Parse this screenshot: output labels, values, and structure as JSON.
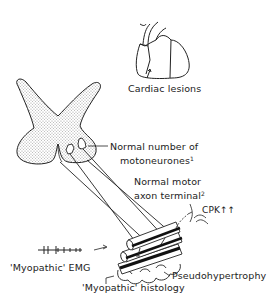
{
  "diagram": {
    "labels": {
      "cardiac": "Cardiac lesions",
      "motoneurones_line1": "Normal number of",
      "motoneurones_line2": "motoneurones",
      "motoneurones_ref": "1",
      "axon_line1": "Normal motor",
      "axon_line2": "axon terminal",
      "axon_ref": "2",
      "cpk": "CPK↑↑",
      "emg": "'Myopathic' EMG",
      "pseudo": "Pseudohypertrophy",
      "histology": "'Myopathic' histology"
    },
    "elements": [
      "heart-icon",
      "spinal-cord-cross-section",
      "motoneurone-cell-bodies",
      "motor-axons",
      "muscle-fibres",
      "emg-trace",
      "blood-vessel"
    ],
    "colors": {
      "line": "#222222",
      "stipple": "#bdbdbd",
      "background": "#ffffff"
    }
  }
}
